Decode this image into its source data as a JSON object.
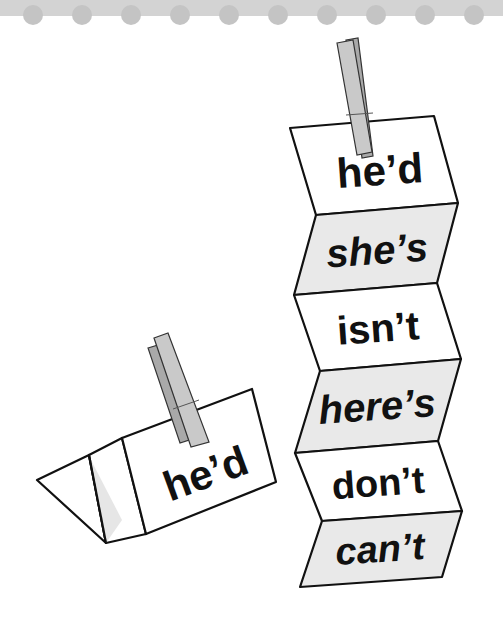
{
  "header": {
    "band_color": "#d3d3d3",
    "dot_color": "#c4c4c4",
    "dot_count": 10
  },
  "folded_strip": {
    "panels": [
      {
        "word": "he'd",
        "style": "normal",
        "shade": "#ffffff"
      },
      {
        "word": "she's",
        "style": "italic",
        "shade": "#e9e9e9"
      },
      {
        "word": "isn't",
        "style": "normal",
        "shade": "#ffffff"
      },
      {
        "word": "here's",
        "style": "italic",
        "shade": "#e9e9e9"
      },
      {
        "word": "don't",
        "style": "normal",
        "shade": "#ffffff"
      },
      {
        "word": "can't",
        "style": "italic",
        "shade": "#e9e9e9"
      }
    ],
    "clothespin": "clothespin-icon"
  },
  "tent_card": {
    "word": "he'd",
    "clothespin": "clothespin-icon"
  },
  "colors": {
    "outline": "#111111",
    "pin": "#c9c9c9",
    "pin_shadow": "#a9a9a9"
  }
}
